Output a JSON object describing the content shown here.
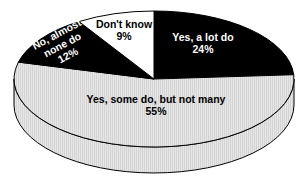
{
  "chart_data": {
    "type": "pie",
    "style": "3d",
    "title": "",
    "slices": [
      {
        "label": "Yes, a lot do",
        "value": 24,
        "display": "24%",
        "color": "#000000",
        "text_color": "#ffffff"
      },
      {
        "label": "Yes, some do, but not many",
        "value": 55,
        "display": "55%",
        "color": "#e2e2e2",
        "text_color": "#000000"
      },
      {
        "label": "No, almost none do",
        "value": 12,
        "display": "12%",
        "color": "#000000",
        "text_color": "#ffffff"
      },
      {
        "label": "Don't know",
        "value": 9,
        "display": "9%",
        "color": "#ffffff",
        "text_color": "#000000"
      }
    ],
    "label_lines": [
      [
        "Yes, a lot do",
        "24%"
      ],
      [
        "Yes, some do, but not many",
        "55%"
      ],
      [
        "No, almost",
        "none do",
        "12%"
      ],
      [
        "Don't know",
        "9%"
      ]
    ],
    "start_angle_deg": 0,
    "direction": "clockwise-from-12-oclock",
    "legend": "none"
  }
}
